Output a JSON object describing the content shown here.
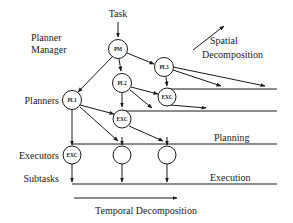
{
  "diagram": {
    "colors": {
      "ink": "#1a1a1a",
      "background": "#ffffff",
      "node_fill": "#ffffff"
    },
    "top_label": "Task",
    "row_labels": {
      "planner_manager_line1": "Planner",
      "planner_manager_line2": "Manager",
      "planners": "Planners",
      "executors": "Executors",
      "subtasks": "Subtasks"
    },
    "side_labels": {
      "planning": "Planning",
      "execution": "Execution"
    },
    "axis_labels": {
      "spatial_line1": "Spatial",
      "spatial_line2": "Decomposition",
      "temporal": "Temporal Decomposition"
    },
    "nodes": [
      {
        "id": "pm",
        "label": "PM",
        "cx": 118,
        "cy": 49,
        "r": 9.5
      },
      {
        "id": "pl3",
        "label": "PL3",
        "cx": 164,
        "cy": 67,
        "r": 9.5
      },
      {
        "id": "pl2",
        "label": "PL2",
        "cx": 122,
        "cy": 83,
        "r": 9.5
      },
      {
        "id": "pl1",
        "label": "PL1",
        "cx": 72,
        "cy": 100,
        "r": 9.5
      },
      {
        "id": "exc3",
        "label": "EXC",
        "cx": 167,
        "cy": 97,
        "r": 9.0
      },
      {
        "id": "exc2",
        "label": "EXC",
        "cx": 122,
        "cy": 119,
        "r": 9.0
      },
      {
        "id": "exc1",
        "label": "EXC",
        "cx": 72,
        "cy": 155,
        "r": 9.0
      },
      {
        "id": "sub2",
        "label": "",
        "cx": 122,
        "cy": 155,
        "r": 9.0
      },
      {
        "id": "sub3",
        "label": "",
        "cx": 167,
        "cy": 155,
        "r": 9.0
      }
    ],
    "timelines": [
      {
        "id": "timeline-pl3",
        "y": 89,
        "x1": 167,
        "x2": 277
      },
      {
        "id": "timeline-pl2",
        "y": 111,
        "x1": 122,
        "x2": 277
      },
      {
        "id": "timeline-pl1",
        "y": 144,
        "x1": 72,
        "x2": 277
      },
      {
        "id": "timeline-sub",
        "y": 184,
        "x1": 72,
        "x2": 277
      }
    ]
  }
}
